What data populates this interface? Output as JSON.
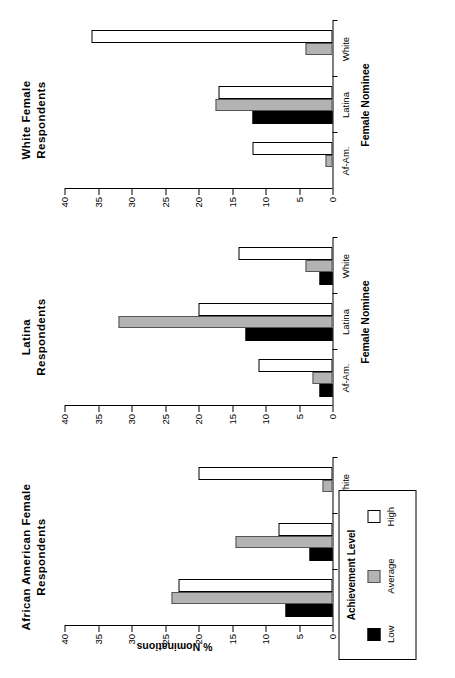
{
  "figure": {
    "yaxis_label": "% Nominations",
    "xaxis_label": "Female  Nominee",
    "orientation_note": "rotated"
  },
  "legend": {
    "title": "Achievement Level",
    "items": [
      {
        "label": "Low",
        "color": "#000000"
      },
      {
        "label": "Average",
        "color": "#b3b3b3"
      },
      {
        "label": "High",
        "color": "#ffffff"
      }
    ]
  },
  "yticks": [
    "0",
    "5",
    "10",
    "15",
    "20",
    "25",
    "30",
    "35",
    "40"
  ],
  "chart_data": {
    "type": "bar",
    "title": "",
    "xlabel": "Female  Nominee",
    "ylabel": "% Nominations",
    "ylim": [
      0,
      40
    ],
    "grid": false,
    "legend_position": "bottom-left",
    "legend_title": "Achievement Level",
    "categories": [
      "Af-Am.",
      "Latina",
      "White"
    ],
    "panels": [
      {
        "title_lines": [
          "African  American  Female",
          "Respondents"
        ],
        "title": "African American Female Respondents",
        "series": [
          {
            "name": "Low",
            "values": [
              7,
              3.5,
              0
            ]
          },
          {
            "name": "Average",
            "values": [
              24,
              14.5,
              1.5
            ]
          },
          {
            "name": "High",
            "values": [
              23,
              8,
              20
            ]
          }
        ]
      },
      {
        "title_lines": [
          "Latina",
          "Respondents"
        ],
        "title": "Latina Respondents",
        "series": [
          {
            "name": "Low",
            "values": [
              2,
              13,
              2
            ]
          },
          {
            "name": "Average",
            "values": [
              3,
              32,
              4
            ]
          },
          {
            "name": "High",
            "values": [
              11,
              20,
              14
            ]
          }
        ]
      },
      {
        "title_lines": [
          "White  Female",
          "Respondents"
        ],
        "title": "White Female Respondents",
        "series": [
          {
            "name": "Low",
            "values": [
              0,
              12,
              0
            ]
          },
          {
            "name": "Average",
            "values": [
              1,
              17.5,
              4
            ]
          },
          {
            "name": "High",
            "values": [
              12,
              17,
              36
            ]
          }
        ]
      }
    ]
  }
}
